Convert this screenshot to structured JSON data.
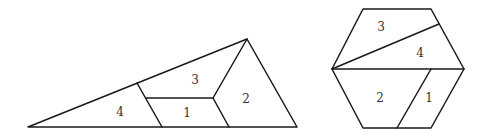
{
  "figures": [
    {
      "name": "triangle-dissection",
      "outline": [
        [
          28,
          127
        ],
        [
          247,
          39
        ],
        [
          297,
          127
        ]
      ],
      "cuts": [
        [
          [
            137,
            83
          ],
          [
            162,
            127
          ]
        ],
        [
          [
            146,
            98
          ],
          [
            213,
            98
          ]
        ],
        [
          [
            213,
            98
          ],
          [
            247,
            39
          ]
        ],
        [
          [
            213,
            98
          ],
          [
            229,
            127
          ]
        ]
      ],
      "pieces": [
        {
          "label": "4",
          "x": 120,
          "y": 112
        },
        {
          "label": "3",
          "x": 195,
          "y": 80
        },
        {
          "label": "1",
          "x": 187,
          "y": 113
        },
        {
          "label": "2",
          "x": 246,
          "y": 99
        }
      ]
    },
    {
      "name": "hexagon-dissection",
      "outline": [
        [
          332,
          69
        ],
        [
          363,
          9
        ],
        [
          431,
          9
        ],
        [
          464,
          69
        ],
        [
          431,
          128
        ],
        [
          363,
          128
        ]
      ],
      "cuts": [
        [
          [
            332,
            69
          ],
          [
            439,
            24
          ]
        ],
        [
          [
            332,
            69
          ],
          [
            464,
            69
          ]
        ],
        [
          [
            431,
            69
          ],
          [
            397,
            128
          ]
        ]
      ],
      "pieces": [
        {
          "label": "3",
          "x": 381,
          "y": 27
        },
        {
          "label": "4",
          "x": 420,
          "y": 53
        },
        {
          "label": "2",
          "x": 380,
          "y": 98
        },
        {
          "label": "1",
          "x": 429,
          "y": 98
        }
      ]
    }
  ],
  "colors": {
    "stroke": "#1a1a1a",
    "label": "#333333",
    "background": "#ffffff"
  }
}
